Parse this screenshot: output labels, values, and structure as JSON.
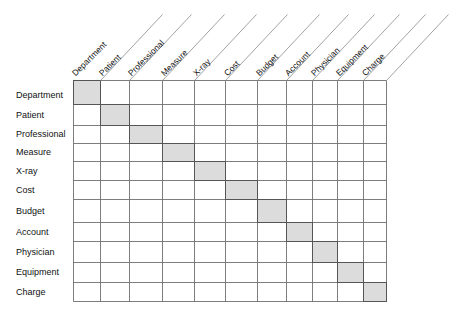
{
  "diagram": {
    "type": "design-structure-matrix",
    "entities": [
      "Department",
      "Patient",
      "Professional",
      "Measure",
      "X-ray",
      "Cost",
      "Budget",
      "Account",
      "Physician",
      "Equipment",
      "Charge"
    ],
    "row_labels": [
      "Department",
      "Patient",
      "Professional",
      "Measure",
      "X-ray",
      "Cost",
      "Budget",
      "Account",
      "Physician",
      "Equipment",
      "Charge"
    ],
    "column_labels": [
      "Department",
      "Patient",
      "Professional",
      "Measure",
      "X-ray",
      "Cost",
      "Budget",
      "Account",
      "Physician",
      "Equipment",
      "Charge"
    ],
    "shaded_cells": "diagonal",
    "colors": {
      "grid_line": "#6e6e6e",
      "shaded_fill": "#dcdcdc",
      "shaded_border": "#555555",
      "diagonal_line": "#8a8a8a",
      "text": "#111111",
      "background": "#ffffff"
    }
  },
  "layout": {
    "col_x": [
      73,
      100,
      129,
      162,
      194,
      225,
      257,
      286,
      312,
      337,
      363,
      386
    ],
    "row_y": [
      80,
      104,
      125,
      143,
      161,
      180,
      199,
      222,
      241,
      262,
      282,
      301
    ],
    "diag_dx": 62,
    "diag_dy": 66
  }
}
